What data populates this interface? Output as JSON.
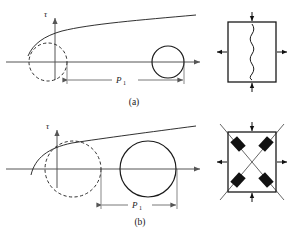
{
  "figure": {
    "background_color": "#ffffff",
    "stroke_color": "#1a1a1a",
    "axis_color": "#555555",
    "block_fill": "#111111",
    "panels": [
      {
        "id": "panel-a",
        "caption": "(a)",
        "vertical_axis_label": "τ",
        "dimension_label": "P",
        "dimension_subscript": "1",
        "description": "Mohr circle diagram with failure envelope, dashed circle at origin and solid offset circle",
        "failure_envelope": {
          "type": "curve",
          "points": [
            [
              30,
              52
            ],
            [
              40,
              40
            ],
            [
              60,
              32
            ],
            [
              90,
              26
            ],
            [
              130,
              22
            ],
            [
              170,
              18
            ],
            [
              196,
              15
            ]
          ]
        },
        "dashed_circle": {
          "cx": 48,
          "cy": 62,
          "r": 19
        },
        "solid_circle": {
          "cx": 168,
          "cy": 62,
          "r": 16
        },
        "horizontal_axis": {
          "x1": 6,
          "y": 62,
          "x2": 203
        },
        "vertical_axis": {
          "x": 55,
          "y1": 78,
          "y2": 16
        },
        "dimension_line": {
          "x1": 67,
          "x2": 184,
          "y": 80
        },
        "element_box": {
          "x": 228,
          "y": 22,
          "w": 48,
          "h": 60,
          "internal_mark": "vertical-wavy-crack",
          "arrows_in": [
            "top",
            "bottom"
          ],
          "arrows_out": [
            "left",
            "right"
          ]
        }
      },
      {
        "id": "panel-b",
        "caption": "(b)",
        "vertical_axis_label": "τ",
        "dimension_label": "P",
        "dimension_subscript": "1",
        "description": "Mohr circle diagram with larger dashed circle at origin and larger solid offset circle",
        "failure_envelope": {
          "type": "curve",
          "points": [
            [
              32,
              172
            ],
            [
              42,
              155
            ],
            [
              62,
              145
            ],
            [
              95,
              140
            ],
            [
              135,
              134
            ],
            [
              175,
              129
            ],
            [
              196,
              126
            ]
          ]
        },
        "dashed_circle": {
          "cx": 73,
          "cy": 169,
          "r": 28
        },
        "solid_circle": {
          "cx": 148,
          "cy": 169,
          "r": 28
        },
        "horizontal_axis": {
          "x1": 6,
          "y": 169,
          "x2": 203
        },
        "vertical_axis": {
          "x": 57,
          "y1": 186,
          "y2": 128
        },
        "dimension_line": {
          "x1": 101,
          "x2": 177,
          "y": 205
        },
        "element_box": {
          "x": 228,
          "y": 132,
          "w": 48,
          "h": 60,
          "internal_mark": "x-shear-bands-with-blocks",
          "arrows_in": [
            "top",
            "bottom"
          ],
          "arrows_out": [
            "left",
            "right"
          ]
        }
      }
    ]
  }
}
